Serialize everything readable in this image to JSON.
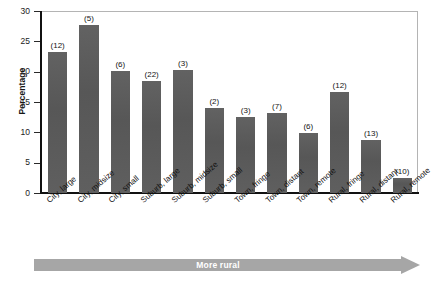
{
  "chart_data": {
    "type": "bar",
    "title": "",
    "xlabel": "",
    "ylabel": "Percentage",
    "ylim": [
      0,
      30
    ],
    "yticks": [
      0,
      5,
      10,
      15,
      20,
      25,
      30
    ],
    "grid": false,
    "legend": null,
    "annotation": "More rural",
    "bar_color": "#5d5d5d",
    "categories": [
      "City, large",
      "City, midsize",
      "City, small",
      "Suburb, large",
      "Suburb, midsize",
      "Suburb, small",
      "Town, fringe",
      "Town, distant",
      "Town, remote",
      "Rural, fringe",
      "Rural, distant",
      "Rural, remote"
    ],
    "values": [
      23.2,
      27.7,
      20.1,
      18.5,
      20.2,
      14.0,
      12.5,
      13.2,
      9.9,
      16.6,
      8.7,
      2.5
    ],
    "point_labels": [
      "(12)",
      "(5)",
      "(6)",
      "(22)",
      "(3)",
      "(2)",
      "(3)",
      "(7)",
      "(6)",
      "(12)",
      "(13)",
      "(10)"
    ]
  }
}
